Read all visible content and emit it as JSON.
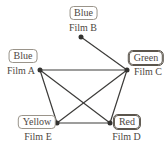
{
  "diagram": {
    "ink": "#3d3c3a",
    "background": "#ffffff",
    "nodes": [
      {
        "id": "film-b",
        "film": "Film B",
        "color_label": "Blue",
        "emphasized": false
      },
      {
        "id": "film-a",
        "film": "Film A",
        "color_label": "Blue",
        "emphasized": false
      },
      {
        "id": "film-c",
        "film": "Film C",
        "color_label": "Green",
        "emphasized": true
      },
      {
        "id": "film-e",
        "film": "Film E",
        "color_label": "Yellow",
        "emphasized": false
      },
      {
        "id": "film-d",
        "film": "Film D",
        "color_label": "Red",
        "emphasized": true
      }
    ],
    "edges": [
      [
        "film-b",
        "film-c"
      ],
      [
        "film-a",
        "film-c"
      ],
      [
        "film-a",
        "film-e"
      ],
      [
        "film-a",
        "film-d"
      ],
      [
        "film-c",
        "film-e"
      ],
      [
        "film-c",
        "film-d"
      ],
      [
        "film-e",
        "film-d"
      ]
    ]
  }
}
